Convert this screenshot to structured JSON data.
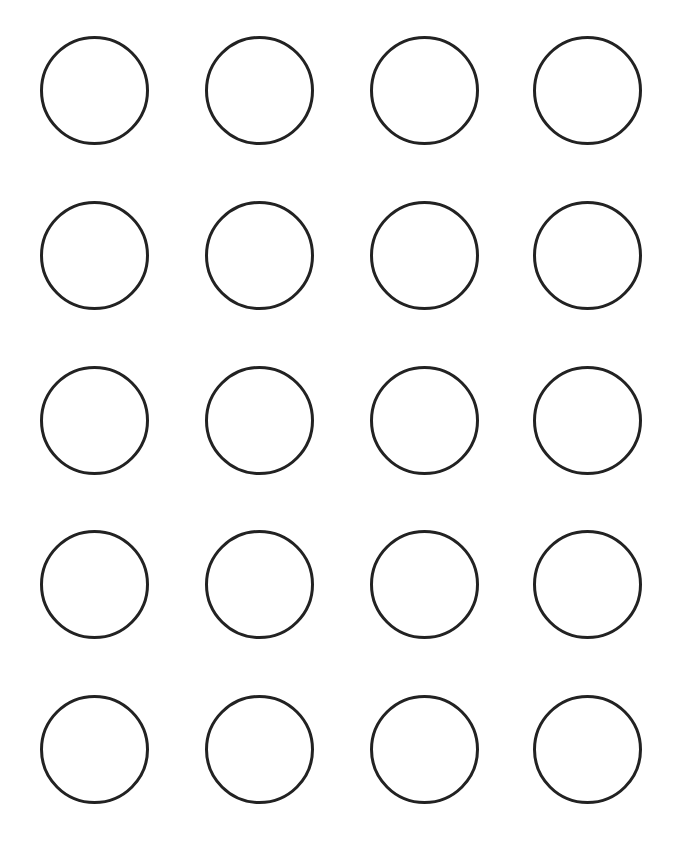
{
  "template": {
    "type": "circle-grid",
    "rows": 5,
    "columns": 4,
    "circle_diameter": 109,
    "stroke_width": 3,
    "stroke_color": "#222222",
    "fill_color": "#ffffff",
    "background_color": "#ffffff",
    "column_centers": [
      94,
      259,
      424,
      587
    ],
    "row_centers": [
      90,
      255,
      420,
      584,
      749
    ]
  }
}
